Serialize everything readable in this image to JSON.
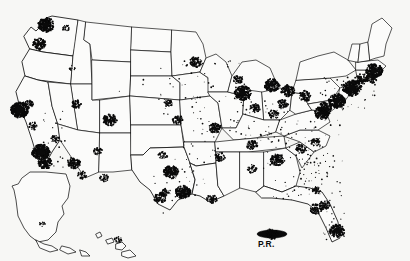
{
  "figure": {
    "type": "dot-density-map",
    "width": 410,
    "height": 261,
    "background_color": "#f7f7f5",
    "dot_color": "#0a0a0a",
    "outline_color": "#111111",
    "land_fill": "#fbfbfa"
  },
  "labels": {
    "puerto_rico": "P.R.",
    "louisiana_abbr": "LA",
    "mississippi_abbr": "MS"
  },
  "insets": [
    {
      "name": "alaska",
      "label": ""
    },
    {
      "name": "hawaii",
      "label": ""
    },
    {
      "name": "puerto-rico",
      "label": "P.R."
    }
  ],
  "chart_data": {
    "type": "scatter",
    "title": "",
    "xlabel": "",
    "ylabel": "",
    "projection": "albers-usa",
    "grid": false,
    "legend": false,
    "clusters": [
      {
        "name": "Seattle",
        "x": 46,
        "y": 25,
        "density": 9
      },
      {
        "name": "Portland",
        "x": 39,
        "y": 44,
        "density": 7
      },
      {
        "name": "Spokane",
        "x": 66,
        "y": 28,
        "density": 3
      },
      {
        "name": "Boise",
        "x": 72,
        "y": 68,
        "density": 2
      },
      {
        "name": "San Francisco Bay Area",
        "x": 20,
        "y": 110,
        "density": 10
      },
      {
        "name": "Sacramento",
        "x": 28,
        "y": 104,
        "density": 5
      },
      {
        "name": "Fresno",
        "x": 33,
        "y": 126,
        "density": 4
      },
      {
        "name": "Los Angeles",
        "x": 41,
        "y": 152,
        "density": 10
      },
      {
        "name": "San Diego",
        "x": 45,
        "y": 163,
        "density": 7
      },
      {
        "name": "Las Vegas",
        "x": 55,
        "y": 139,
        "density": 4
      },
      {
        "name": "Phoenix",
        "x": 74,
        "y": 163,
        "density": 7
      },
      {
        "name": "Tucson",
        "x": 82,
        "y": 175,
        "density": 4
      },
      {
        "name": "Salt Lake City",
        "x": 76,
        "y": 104,
        "density": 5
      },
      {
        "name": "Denver",
        "x": 110,
        "y": 120,
        "density": 7
      },
      {
        "name": "Albuquerque",
        "x": 98,
        "y": 151,
        "density": 4
      },
      {
        "name": "El Paso",
        "x": 104,
        "y": 178,
        "density": 4
      },
      {
        "name": "Oklahoma City",
        "x": 163,
        "y": 155,
        "density": 4
      },
      {
        "name": "Dallas-Fort Worth",
        "x": 171,
        "y": 172,
        "density": 8
      },
      {
        "name": "Austin",
        "x": 166,
        "y": 192,
        "density": 4
      },
      {
        "name": "San Antonio",
        "x": 160,
        "y": 198,
        "density": 6
      },
      {
        "name": "Houston",
        "x": 183,
        "y": 192,
        "density": 8
      },
      {
        "name": "Kansas City",
        "x": 178,
        "y": 120,
        "density": 5
      },
      {
        "name": "Omaha",
        "x": 168,
        "y": 103,
        "density": 4
      },
      {
        "name": "Minneapolis-St Paul",
        "x": 196,
        "y": 62,
        "density": 6
      },
      {
        "name": "Chicago",
        "x": 243,
        "y": 93,
        "density": 9
      },
      {
        "name": "Milwaukee",
        "x": 238,
        "y": 79,
        "density": 5
      },
      {
        "name": "St Louis",
        "x": 215,
        "y": 128,
        "density": 6
      },
      {
        "name": "Detroit",
        "x": 272,
        "y": 85,
        "density": 8
      },
      {
        "name": "Cleveland",
        "x": 288,
        "y": 91,
        "density": 7
      },
      {
        "name": "Cincinnati",
        "x": 274,
        "y": 114,
        "density": 5
      },
      {
        "name": "Indianapolis",
        "x": 255,
        "y": 108,
        "density": 5
      },
      {
        "name": "Columbus",
        "x": 283,
        "y": 104,
        "density": 5
      },
      {
        "name": "Pittsburgh",
        "x": 305,
        "y": 96,
        "density": 6
      },
      {
        "name": "Memphis",
        "x": 220,
        "y": 157,
        "density": 5
      },
      {
        "name": "Nashville",
        "x": 252,
        "y": 145,
        "density": 5
      },
      {
        "name": "New Orleans",
        "x": 212,
        "y": 199,
        "density": 5
      },
      {
        "name": "Birmingham",
        "x": 252,
        "y": 169,
        "density": 4
      },
      {
        "name": "Atlanta",
        "x": 277,
        "y": 160,
        "density": 7
      },
      {
        "name": "Charlotte",
        "x": 300,
        "y": 149,
        "density": 5
      },
      {
        "name": "Raleigh",
        "x": 315,
        "y": 142,
        "density": 4
      },
      {
        "name": "Washington DC",
        "x": 322,
        "y": 113,
        "density": 8
      },
      {
        "name": "Baltimore",
        "x": 325,
        "y": 108,
        "density": 7
      },
      {
        "name": "Philadelphia",
        "x": 337,
        "y": 101,
        "density": 9
      },
      {
        "name": "New York City",
        "x": 352,
        "y": 88,
        "density": 10
      },
      {
        "name": "Hartford",
        "x": 362,
        "y": 79,
        "density": 6
      },
      {
        "name": "Providence",
        "x": 372,
        "y": 78,
        "density": 6
      },
      {
        "name": "Boston",
        "x": 374,
        "y": 71,
        "density": 9
      },
      {
        "name": "Jacksonville",
        "x": 316,
        "y": 190,
        "density": 4
      },
      {
        "name": "Orlando",
        "x": 325,
        "y": 205,
        "density": 5
      },
      {
        "name": "Tampa",
        "x": 316,
        "y": 209,
        "density": 6
      },
      {
        "name": "Miami",
        "x": 337,
        "y": 231,
        "density": 8
      },
      {
        "name": "Anchorage",
        "x": 42,
        "y": 224,
        "density": 2
      },
      {
        "name": "Honolulu",
        "x": 118,
        "y": 240,
        "density": 3
      },
      {
        "name": "San Juan",
        "x": 272,
        "y": 234,
        "density": 6
      }
    ]
  }
}
